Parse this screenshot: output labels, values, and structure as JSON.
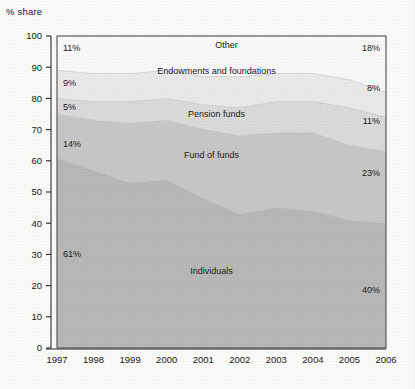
{
  "chart_data": {
    "type": "area",
    "title": "",
    "ylabel": "% share",
    "xlabel": "",
    "ylim": [
      0,
      100
    ],
    "yticks": [
      0,
      10,
      20,
      30,
      40,
      50,
      60,
      70,
      80,
      90,
      100
    ],
    "grid": false,
    "legend": "inline-labels",
    "stacked": true,
    "stack_order": "bottom-to-top",
    "x": [
      1997,
      1998,
      1999,
      2000,
      2001,
      2002,
      2003,
      2004,
      2005,
      2006
    ],
    "categories": [
      "1997",
      "1998",
      "1999",
      "2000",
      "2001",
      "2002",
      "2003",
      "2004",
      "2005",
      "2006"
    ],
    "series": [
      {
        "name": "Individuals",
        "color": "#b9b9b9",
        "values": [
          61,
          57,
          53,
          54,
          48,
          43,
          45,
          44,
          41,
          40
        ],
        "start_label": "61%",
        "end_label": "40%"
      },
      {
        "name": "Fund of funds",
        "color": "#c9c9c9",
        "values": [
          14,
          16,
          19,
          19,
          22,
          25,
          24,
          25,
          24,
          23
        ],
        "start_label": "14%",
        "end_label": "23%"
      },
      {
        "name": "Pension funds",
        "color": "#dcdcdc",
        "values": [
          5,
          6,
          7,
          7,
          8,
          9,
          10,
          10,
          12,
          11
        ],
        "start_label": "5%",
        "end_label": "11%"
      },
      {
        "name": "Endowments and foundations",
        "color": "#ececec",
        "values": [
          9,
          9,
          9,
          9,
          9,
          10,
          9,
          9,
          9,
          8
        ],
        "start_label": "9%",
        "end_label": "8%"
      },
      {
        "name": "Other",
        "color": "#fbfbfb",
        "values": [
          11,
          12,
          12,
          11,
          13,
          13,
          12,
          12,
          14,
          18
        ],
        "start_label": "11%",
        "end_label": "18%"
      }
    ]
  },
  "axis": {
    "y_title": "% share",
    "y_tick_labels": [
      "100",
      "90",
      "80",
      "70",
      "60",
      "50",
      "40",
      "30",
      "20",
      "10",
      "0"
    ],
    "x_tick_labels": [
      "1997",
      "1998",
      "1999",
      "2000",
      "2001",
      "2002",
      "2003",
      "2004",
      "2005",
      "2006"
    ]
  },
  "labels": {
    "individuals": "Individuals",
    "fund_of_funds": "Fund of funds",
    "pension_funds": "Pension funds",
    "endowments": "Endowments and foundations",
    "other": "Other",
    "individuals_start": "61%",
    "individuals_end": "40%",
    "fof_start": "14%",
    "fof_end": "23%",
    "pension_start": "5%",
    "pension_end": "11%",
    "endow_start": "9%",
    "endow_end": "8%",
    "other_start": "11%",
    "other_end": "18%"
  }
}
